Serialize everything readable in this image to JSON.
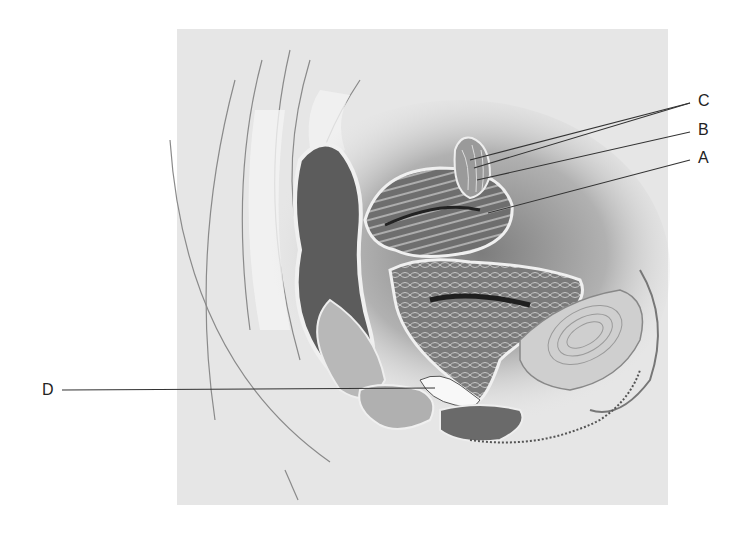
{
  "figure": {
    "type": "anatomical-illustration",
    "view": "midsagittal section, female pelvis",
    "background_color": "#e6e6e6",
    "labels": [
      {
        "id": "C",
        "text": "C",
        "x": 700,
        "y": 100
      },
      {
        "id": "B",
        "text": "B",
        "x": 700,
        "y": 130
      },
      {
        "id": "A",
        "text": "A",
        "x": 700,
        "y": 157
      },
      {
        "id": "D",
        "text": "D",
        "x": 45,
        "y": 390
      }
    ]
  }
}
